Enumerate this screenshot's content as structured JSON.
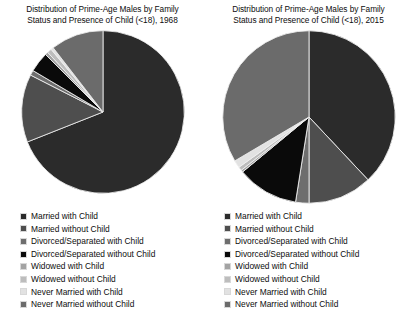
{
  "charts": [
    {
      "title_line1": "Distribution of Prime-Age Males by Family",
      "title_line2": "Status and Presence of Child (<18), 1968",
      "year": "1968"
    },
    {
      "title_line1": "Distribution of Prime-Age Males by Family",
      "title_line2": "Status and Presence of Child (<18), 2015",
      "year": "2015"
    }
  ],
  "legend": {
    "items": [
      {
        "label": "Married with Child",
        "color": "#2b2b2b"
      },
      {
        "label": "Married without Child",
        "color": "#4e4e4e"
      },
      {
        "label": "Divorced/Separated with Child",
        "color": "#6e6e6e"
      },
      {
        "label": "Divorced/Separated without Child",
        "color": "#0a0a0a"
      },
      {
        "label": "Widowed with Child",
        "color": "#a3a3a3"
      },
      {
        "label": "Widowed without Child",
        "color": "#bdbdbd"
      },
      {
        "label": "Never Married with Child",
        "color": "#e2e2e2"
      },
      {
        "label": "Never Married without Child",
        "color": "#6b6b6b"
      }
    ]
  },
  "chart_data": [
    {
      "type": "pie",
      "title": "Distribution of Prime-Age Males by Family Status and Presence of Child (<18), 1968",
      "year": 1968,
      "start_angle_deg": 0,
      "direction": "clockwise",
      "labels": [
        "Married with Child",
        "Married without Child",
        "Divorced/Separated with Child",
        "Divorced/Separated without Child",
        "Widowed with Child",
        "Widowed without Child",
        "Never Married with Child",
        "Never Married without Child"
      ],
      "values": [
        69.0,
        13.5,
        1.0,
        4.0,
        0.6,
        0.9,
        0.5,
        10.5
      ],
      "unit": "percent",
      "colors": [
        "#2b2b2b",
        "#4e4e4e",
        "#6e6e6e",
        "#0a0a0a",
        "#a3a3a3",
        "#bdbdbd",
        "#e2e2e2",
        "#6b6b6b"
      ],
      "legend_position": "below"
    },
    {
      "type": "pie",
      "title": "Distribution of Prime-Age Males by Family Status and Presence of Child (<18), 2015",
      "year": 2015,
      "start_angle_deg": 0,
      "direction": "clockwise",
      "labels": [
        "Married with Child",
        "Married without Child",
        "Divorced/Separated with Child",
        "Divorced/Separated without Child",
        "Widowed with Child",
        "Widowed without Child",
        "Never Married with Child",
        "Never Married without Child"
      ],
      "values": [
        38.0,
        12.0,
        2.5,
        11.5,
        0.4,
        0.7,
        1.4,
        33.5
      ],
      "unit": "percent",
      "colors": [
        "#2b2b2b",
        "#4e4e4e",
        "#6e6e6e",
        "#0a0a0a",
        "#a3a3a3",
        "#bdbdbd",
        "#e2e2e2",
        "#6b6b6b"
      ],
      "legend_position": "below"
    }
  ]
}
